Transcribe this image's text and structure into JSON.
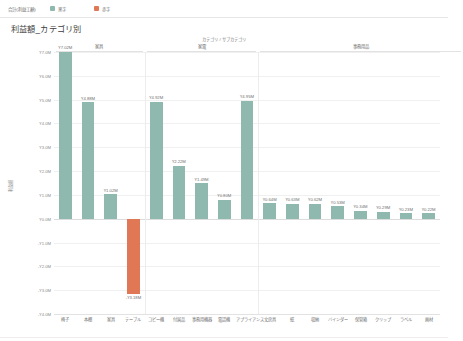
{
  "topbar": {
    "measure_label": "合計(利益工額)",
    "legend": [
      {
        "label": "黒字",
        "color": "#8fb8ae",
        "icon": "legend-swatch-green"
      },
      {
        "label": "赤字",
        "color": "#e07856",
        "icon": "legend-swatch-red"
      }
    ]
  },
  "chart_data": {
    "type": "bar",
    "title": "利益額_カテゴリ別",
    "xlabel": "カテゴリ / サブカテゴリ",
    "ylabel": "利益額",
    "ylim": [
      -4000000,
      7000000
    ],
    "grid": true,
    "legend_position": "top",
    "value_format": "¥0.00M",
    "ytick_labels": [
      "¥7.0M",
      "¥6.0M",
      "¥5.0M",
      "¥4.0M",
      "¥3.0M",
      "¥2.0M",
      "¥1.0M",
      "¥0.0M",
      "-¥1.0M",
      "-¥2.0M",
      "-¥3.0M",
      "-¥4.0M"
    ],
    "ytick_values": [
      7000000,
      6000000,
      5000000,
      4000000,
      3000000,
      2000000,
      1000000,
      0,
      -1000000,
      -2000000,
      -3000000,
      -4000000
    ],
    "groups": [
      {
        "label": "家具",
        "count": 4
      },
      {
        "label": "家電",
        "count": 5
      },
      {
        "label": "事務用品",
        "count": 9
      }
    ],
    "categories": [
      "椅子",
      "本棚",
      "家具",
      "テーブル",
      "コピー機",
      "付属品",
      "事務用機器",
      "電話機",
      "アプライアンス",
      "文房具",
      "紙",
      "収納",
      "バインダー",
      "保管箱",
      "クリップ",
      "ラベル",
      "画材"
    ],
    "values": [
      7020000,
      4880000,
      1020000,
      -3180000,
      4920000,
      2220000,
      1490000,
      800000,
      4950000,
      640000,
      630000,
      620000,
      530000,
      340000,
      290000,
      230000,
      220000
    ],
    "labels": [
      "¥7.02M",
      "¥4.88M",
      "¥1.02M",
      "-¥3.18M",
      "¥4.92M",
      "¥2.22M",
      "¥1.49M",
      "¥0.80M",
      "¥4.95M",
      "¥0.64M",
      "¥0.63M",
      "¥0.62M",
      "¥0.53M",
      "¥0.34M",
      "¥0.29M",
      "¥0.23M",
      "¥0.22M"
    ],
    "colors": [
      "#8fb8ae",
      "#8fb8ae",
      "#8fb8ae",
      "#e07856",
      "#8fb8ae",
      "#8fb8ae",
      "#8fb8ae",
      "#8fb8ae",
      "#8fb8ae",
      "#8fb8ae",
      "#8fb8ae",
      "#8fb8ae",
      "#8fb8ae",
      "#8fb8ae",
      "#8fb8ae",
      "#8fb8ae",
      "#8fb8ae"
    ]
  }
}
